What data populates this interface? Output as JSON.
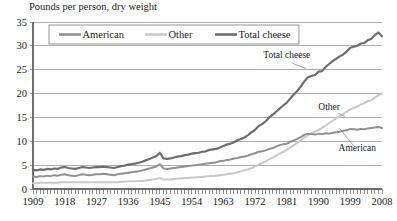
{
  "chart_data": {
    "type": "line",
    "title": "Pounds per person, dry weight",
    "xlabel": "",
    "ylabel": "Pounds per person, dry weight",
    "xlim": [
      1909,
      2008
    ],
    "ylim": [
      0,
      35
    ],
    "yticks": [
      0,
      5,
      10,
      15,
      20,
      25,
      30,
      35
    ],
    "xticks": [
      1909,
      1918,
      1927,
      1936,
      1945,
      1954,
      1963,
      1972,
      1981,
      1990,
      1999,
      2008
    ],
    "grid": true,
    "legend_position": "top-center",
    "legend": [
      "American",
      "Other",
      "Total cheese"
    ],
    "colors": {
      "American": "#909090",
      "Other": "#c9c9c9",
      "Total cheese": "#6e6e6e",
      "gridline": "#9a9a9a",
      "axis": "#6d6d6d",
      "text": "#1a1a1a",
      "background": "#ffffff"
    },
    "annotations": [
      {
        "text": "Total cheese",
        "x": 1981,
        "y": 27.5
      },
      {
        "text": "Other",
        "x": 1993,
        "y": 16.6
      },
      {
        "text": "American",
        "x": 2001,
        "y": 8.0
      }
    ],
    "x": [
      1909,
      1910,
      1911,
      1912,
      1913,
      1914,
      1915,
      1916,
      1917,
      1918,
      1919,
      1920,
      1921,
      1922,
      1923,
      1924,
      1925,
      1926,
      1927,
      1928,
      1929,
      1930,
      1931,
      1932,
      1933,
      1934,
      1935,
      1936,
      1937,
      1938,
      1939,
      1940,
      1941,
      1942,
      1943,
      1944,
      1945,
      1946,
      1947,
      1948,
      1949,
      1950,
      1951,
      1952,
      1953,
      1954,
      1955,
      1956,
      1957,
      1958,
      1959,
      1960,
      1961,
      1962,
      1963,
      1964,
      1965,
      1966,
      1967,
      1968,
      1969,
      1970,
      1971,
      1972,
      1973,
      1974,
      1975,
      1976,
      1977,
      1978,
      1979,
      1980,
      1981,
      1982,
      1983,
      1984,
      1985,
      1986,
      1987,
      1988,
      1989,
      1990,
      1991,
      1992,
      1993,
      1994,
      1995,
      1996,
      1997,
      1998,
      1999,
      2000,
      2001,
      2002,
      2003,
      2004,
      2005,
      2006,
      2007,
      2008
    ],
    "series": [
      {
        "name": "Total cheese",
        "color": "#6e6e6e",
        "values": [
          4.0,
          3.9,
          4.1,
          4.0,
          4.2,
          4.1,
          4.3,
          4.2,
          4.5,
          4.6,
          4.4,
          4.3,
          4.2,
          4.4,
          4.6,
          4.5,
          4.4,
          4.5,
          4.6,
          4.6,
          4.7,
          4.6,
          4.5,
          4.4,
          4.6,
          4.8,
          4.9,
          5.1,
          5.2,
          5.3,
          5.5,
          5.7,
          6.0,
          6.3,
          6.6,
          6.9,
          7.6,
          6.4,
          6.3,
          6.4,
          6.6,
          6.8,
          6.9,
          7.1,
          7.2,
          7.4,
          7.5,
          7.6,
          7.8,
          7.9,
          8.2,
          8.3,
          8.4,
          8.7,
          9.0,
          9.3,
          9.5,
          9.8,
          10.2,
          10.5,
          10.8,
          11.3,
          11.9,
          12.4,
          13.2,
          13.6,
          14.2,
          15.0,
          15.6,
          16.2,
          16.9,
          17.5,
          18.1,
          19.0,
          19.8,
          20.6,
          21.5,
          22.6,
          23.4,
          23.7,
          23.9,
          24.6,
          24.7,
          25.6,
          26.2,
          26.8,
          27.3,
          27.8,
          28.2,
          28.8,
          29.6,
          29.8,
          30.0,
          30.5,
          30.6,
          31.2,
          31.5,
          32.3,
          32.8,
          32.0
        ]
      },
      {
        "name": "American",
        "color": "#909090",
        "values": [
          2.6,
          2.5,
          2.7,
          2.6,
          2.8,
          2.7,
          2.9,
          2.8,
          3.0,
          3.1,
          2.9,
          2.8,
          2.7,
          2.9,
          3.1,
          3.0,
          2.9,
          3.0,
          3.1,
          3.1,
          3.2,
          3.1,
          3.0,
          2.9,
          3.1,
          3.2,
          3.3,
          3.4,
          3.5,
          3.6,
          3.7,
          3.9,
          4.1,
          4.3,
          4.5,
          4.7,
          5.2,
          4.3,
          4.2,
          4.3,
          4.4,
          4.5,
          4.6,
          4.7,
          4.8,
          4.9,
          5.0,
          5.1,
          5.2,
          5.3,
          5.4,
          5.5,
          5.6,
          5.8,
          5.9,
          6.1,
          6.2,
          6.4,
          6.5,
          6.7,
          6.8,
          7.0,
          7.3,
          7.5,
          7.8,
          7.9,
          8.1,
          8.4,
          8.6,
          8.9,
          9.2,
          9.4,
          9.5,
          9.9,
          10.2,
          10.5,
          10.9,
          11.4,
          11.6,
          11.5,
          11.4,
          11.6,
          11.5,
          11.7,
          11.6,
          11.8,
          11.9,
          12.0,
          12.2,
          12.3,
          12.6,
          12.5,
          12.4,
          12.6,
          12.5,
          12.7,
          12.8,
          12.9,
          13.0,
          12.8
        ]
      },
      {
        "name": "Other",
        "color": "#c9c9c9",
        "values": [
          1.2,
          1.2,
          1.3,
          1.3,
          1.3,
          1.3,
          1.3,
          1.3,
          1.4,
          1.4,
          1.4,
          1.4,
          1.4,
          1.4,
          1.4,
          1.4,
          1.4,
          1.4,
          1.4,
          1.4,
          1.4,
          1.4,
          1.4,
          1.4,
          1.4,
          1.5,
          1.5,
          1.6,
          1.6,
          1.6,
          1.7,
          1.7,
          1.8,
          1.9,
          2.0,
          2.1,
          2.3,
          2.0,
          2.0,
          2.0,
          2.1,
          2.2,
          2.2,
          2.3,
          2.3,
          2.4,
          2.4,
          2.5,
          2.5,
          2.6,
          2.7,
          2.7,
          2.8,
          2.9,
          3.0,
          3.1,
          3.2,
          3.3,
          3.5,
          3.7,
          3.9,
          4.1,
          4.4,
          4.7,
          5.1,
          5.4,
          5.8,
          6.2,
          6.6,
          7.0,
          7.4,
          7.8,
          8.2,
          8.7,
          9.2,
          9.7,
          10.2,
          10.8,
          11.3,
          11.7,
          12.0,
          12.4,
          12.8,
          13.3,
          13.8,
          14.3,
          14.8,
          15.3,
          15.7,
          16.2,
          16.7,
          17.0,
          17.3,
          17.7,
          18.0,
          18.4,
          18.6,
          19.2,
          19.6,
          20.0
        ]
      }
    ]
  },
  "plot_geometry": {
    "left": 33,
    "right": 382,
    "top": 22,
    "bottom": 189
  },
  "legend": {
    "items": [
      {
        "label": "American",
        "color": "#909090"
      },
      {
        "label": "Other",
        "color": "#c9c9c9"
      },
      {
        "label": "Total cheese",
        "color": "#6e6e6e"
      }
    ]
  }
}
